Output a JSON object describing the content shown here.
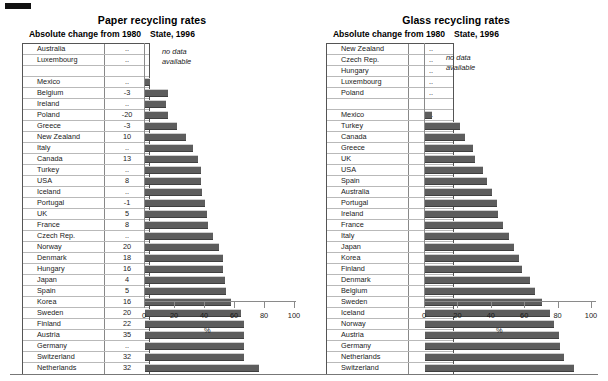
{
  "page": {
    "bottom_rule": true,
    "bar_color": "#5d5d5d",
    "axis_color": "#8a8a8a"
  },
  "panels": [
    {
      "id": "paper",
      "title": "Paper recycling rates",
      "table_header": "Absolute change from 1980",
      "chart_header": "State, 1996",
      "no_data_note": "no data\navailable",
      "axis_unit": "%"
    },
    {
      "id": "glass",
      "title": "Glass recycling rates",
      "table_header": "Absolute change from 1980",
      "chart_header": "State, 1996",
      "no_data_note": "no data\navailable",
      "axis_unit": "%"
    }
  ],
  "axis": {
    "ticks": [
      "0",
      "20",
      "40",
      "60",
      "80",
      "100"
    ],
    "min": 0,
    "max": 100
  },
  "chart_data": [
    {
      "type": "bar",
      "title": "Paper recycling rates",
      "subtitle": "State, 1996",
      "orientation": "horizontal",
      "xlabel": "%",
      "ylabel": "",
      "xlim": [
        0,
        100
      ],
      "xticks": [
        0,
        20,
        40,
        60,
        80,
        100
      ],
      "grid": false,
      "legend": null,
      "table_column_header": "Absolute change from 1980",
      "no_data_note": "no data available",
      "categories": [
        "Australia",
        "Luxembourg",
        "",
        "Mexico",
        "Belgium",
        "Ireland",
        "Poland",
        "Greece",
        "New Zealand",
        "Italy",
        "Canada",
        "Turkey",
        "USA",
        "Iceland",
        "Portugal",
        "UK",
        "France",
        "Czech Rep.",
        "Norway",
        "Denmark",
        "Hungary",
        "Japan",
        "Spain",
        "Korea",
        "Sweden",
        "Finland",
        "Austria",
        "Germany",
        "Switzerland",
        "Netherlands"
      ],
      "absolute_change_1980": [
        "..",
        "..",
        "",
        "..",
        "-3",
        "..",
        "-20",
        "-3",
        "10",
        "..",
        "13",
        "..",
        "8",
        "..",
        "-1",
        "5",
        "8",
        "..",
        "20",
        "18",
        "16",
        "4",
        "5",
        "16",
        "20",
        "22",
        "35",
        "..",
        "32",
        "32"
      ],
      "values_1996": [
        null,
        null,
        null,
        3,
        15,
        14,
        15,
        21,
        27,
        32,
        35,
        37,
        37,
        38,
        40,
        41,
        42,
        45,
        49,
        52,
        52,
        53,
        54,
        57,
        64,
        66,
        66,
        66,
        66,
        76
      ]
    },
    {
      "type": "bar",
      "title": "Glass recycling rates",
      "subtitle": "State, 1996",
      "orientation": "horizontal",
      "xlabel": "%",
      "ylabel": "",
      "xlim": [
        0,
        100
      ],
      "xticks": [
        0,
        20,
        40,
        60,
        80,
        100
      ],
      "grid": false,
      "legend": null,
      "table_column_header": "Absolute change from 1980",
      "no_data_note": "no data available",
      "categories": [
        "New Zealand",
        "Czech Rep.",
        "Hungary",
        "Luxembourg",
        "Poland",
        "",
        "Mexico",
        "Turkey",
        "Canada",
        "Greece",
        "UK",
        "USA",
        "Spain",
        "Australia",
        "Portugal",
        "Ireland",
        "France",
        "Italy",
        "Japan",
        "Korea",
        "Finland",
        "Denmark",
        "Belgium",
        "Sweden",
        "Iceland",
        "Norway",
        "Austria",
        "Germany",
        "Netherlands",
        "Switzerland"
      ],
      "absolute_change_1980": [
        "..",
        "..",
        "..",
        "..",
        "..",
        "",
        "..",
        "..",
        "5",
        "5",
        "17",
        "20",
        "..",
        "..",
        "..",
        "38",
        "30",
        "33",
        "21",
        "..",
        "53",
        "58",
        "33",
        "..",
        "..",
        "..",
        "56",
        "..",
        "64",
        "53"
      ],
      "values_1996": [
        null,
        null,
        null,
        null,
        null,
        null,
        4,
        21,
        24,
        29,
        30,
        35,
        37,
        40,
        43,
        44,
        47,
        50,
        53,
        56,
        58,
        63,
        66,
        70,
        75,
        77,
        80,
        81,
        83,
        89
      ]
    }
  ]
}
